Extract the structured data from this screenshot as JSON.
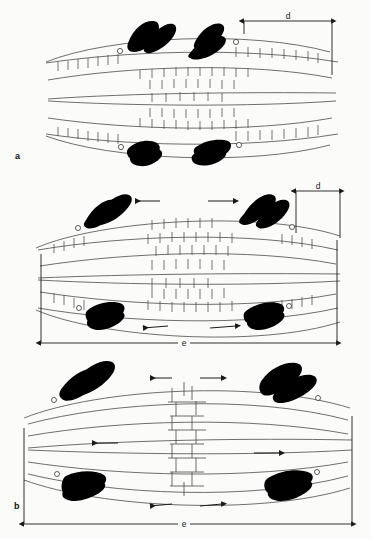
{
  "figure": {
    "background_color": "#fbfbfa",
    "ink_color": "#1a1a1a",
    "chromosome_color": "#000000",
    "fiber_color": "#4a4a4a",
    "width": 371,
    "height": 539
  },
  "panels": [
    {
      "id": "a",
      "label": "a",
      "stage_index": 1,
      "dimensions": [
        {
          "name": "d",
          "label": "d",
          "orientation": "horizontal",
          "position": "top-right",
          "relative_length": "large"
        }
      ],
      "arrows": [],
      "chromosomes": [
        {
          "position": "upper-left",
          "kinetochore": "white-circle"
        },
        {
          "position": "upper-right",
          "kinetochore": "white-circle"
        },
        {
          "position": "lower-left",
          "kinetochore": "white-circle"
        },
        {
          "position": "lower-right",
          "kinetochore": "white-circle"
        }
      ],
      "overlap_zone": {
        "description": "wide central cross-bridge zone",
        "relative_width": "wide"
      }
    },
    {
      "id": "b",
      "label": "b",
      "stage_index": 2,
      "dimensions": [
        {
          "name": "d",
          "label": "d",
          "orientation": "horizontal",
          "position": "top-right",
          "relative_length": "medium"
        },
        {
          "name": "e",
          "label": "e",
          "orientation": "horizontal",
          "position": "bottom-full",
          "relative_length": "full"
        }
      ],
      "arrows": [
        {
          "direction": "left",
          "position": "top-left"
        },
        {
          "direction": "right",
          "position": "top-right"
        },
        {
          "direction": "left",
          "position": "bottom-left"
        },
        {
          "direction": "right",
          "position": "bottom-right"
        }
      ],
      "chromosomes": [
        {
          "position": "upper-left",
          "kinetochore": "white-circle"
        },
        {
          "position": "upper-right",
          "kinetochore": "white-circle"
        },
        {
          "position": "lower-left",
          "kinetochore": "white-circle"
        },
        {
          "position": "lower-right",
          "kinetochore": "white-circle"
        }
      ],
      "overlap_zone": {
        "description": "reduced central cross-bridge zone",
        "relative_width": "medium"
      }
    },
    {
      "id": "c",
      "label": "c",
      "stage_index": 3,
      "dimensions": [
        {
          "name": "e",
          "label": "e",
          "orientation": "horizontal",
          "position": "bottom-full",
          "relative_length": "full"
        }
      ],
      "arrows": [
        {
          "direction": "left",
          "position": "top-left"
        },
        {
          "direction": "right",
          "position": "top-right"
        },
        {
          "direction": "left",
          "position": "mid-left"
        },
        {
          "direction": "right",
          "position": "mid-right"
        },
        {
          "direction": "left",
          "position": "bottom-left"
        },
        {
          "direction": "right",
          "position": "bottom-right"
        }
      ],
      "chromosomes": [
        {
          "position": "upper-left",
          "kinetochore": "white-circle"
        },
        {
          "position": "upper-right",
          "kinetochore": "white-circle"
        },
        {
          "position": "lower-left",
          "kinetochore": "white-circle"
        },
        {
          "position": "lower-right",
          "kinetochore": "white-circle"
        }
      ],
      "overlap_zone": {
        "description": "narrow central cross-bridge zone",
        "relative_width": "narrow"
      }
    }
  ],
  "legend": {
    "d_meaning": "d",
    "e_meaning": "e"
  }
}
